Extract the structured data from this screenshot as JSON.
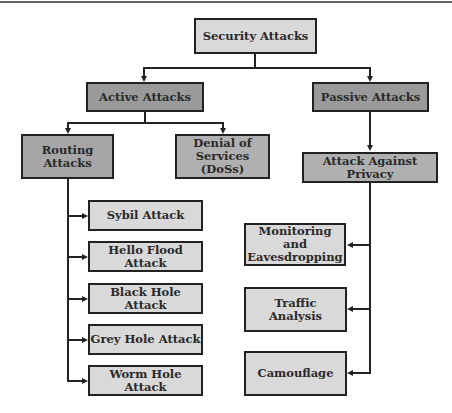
{
  "diagram": {
    "root": {
      "label": "Security Attacks"
    },
    "active": {
      "label": "Active Attacks",
      "children": {
        "routing": {
          "label": "Routing Attacks",
          "items": [
            "Sybil Attack",
            "Hello Flood Attack",
            "Black Hole Attack",
            "Grey Hole Attack",
            "Worm Hole Attack"
          ]
        },
        "dos": {
          "label": "Denial of Services (DoSs)"
        }
      }
    },
    "passive": {
      "label": "Passive Attacks",
      "children": {
        "privacy": {
          "label": "Attack Against Privacy",
          "items": [
            "Monitoring and Eavesdropping",
            "Traffic Analysis",
            "Camouflage"
          ]
        }
      }
    },
    "colors": {
      "light_box": "#d9d9d9",
      "dark_box": "#9a9a9a",
      "border": "#222222"
    }
  }
}
